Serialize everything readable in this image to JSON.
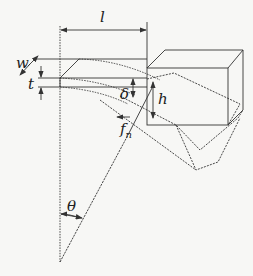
{
  "diagram": {
    "type": "cantilever beam deflection schematic",
    "labels": {
      "length": "l",
      "width": "w",
      "thickness": "t",
      "deflection": "δ",
      "height": "h",
      "force": "f",
      "force_sub": "n",
      "angle": "θ"
    },
    "colors": {
      "background": "#f7f7f5",
      "stroke": "#333333"
    }
  }
}
